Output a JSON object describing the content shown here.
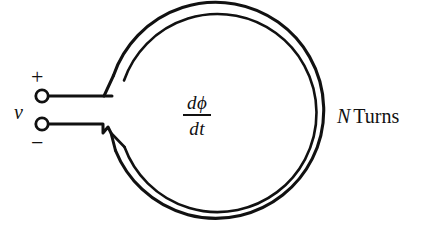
{
  "figure": {
    "background_color": "#ffffff",
    "ink_color": "#111111",
    "labels": {
      "voltage": "v",
      "positive_terminal": "+",
      "negative_terminal": "−",
      "turns": {
        "symbol": "N",
        "word": "Turns"
      },
      "flux_rate": {
        "numerator": "dϕ",
        "denominator": "dt"
      }
    },
    "geometry": {
      "circle_center_x": 222,
      "circle_center_y": 114,
      "outer_radius": 108,
      "inner_radius": 99,
      "gap_top_angle_deg": 188,
      "gap_bottom_angle_deg": 172,
      "top_lead_y": 96,
      "bottom_lead_y": 124,
      "terminal_x": 42,
      "terminal_radius": 6,
      "lead_end_x": 104
    }
  }
}
